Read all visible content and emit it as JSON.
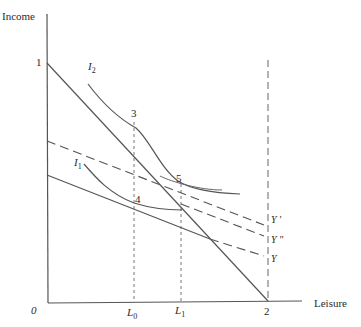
{
  "diagram": {
    "axes": {
      "y_label": "Income",
      "x_label": "Leisure",
      "origin_label": "0"
    },
    "tick_labels": {
      "y_intercept": "1",
      "x_endowment": "2",
      "L0": "L",
      "L0_sub": "0",
      "L1": "L",
      "L1_sub": "1"
    },
    "curves": {
      "I2": "I",
      "I2_sub": "2",
      "I1": "I",
      "I1_sub": "1"
    },
    "points": {
      "p3": "3",
      "p4": "4",
      "p5": "5"
    },
    "line_labels": {
      "y_prime": "Y '",
      "y_double_prime": "Y \"",
      "y": "Y"
    },
    "colors": {
      "line": "#555555",
      "text": "#2a2a2a"
    }
  }
}
